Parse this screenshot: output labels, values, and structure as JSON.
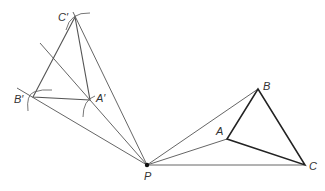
{
  "diagram": {
    "points": {
      "P": {
        "label": "P",
        "x": 147,
        "y": 165
      },
      "A": {
        "label": "A",
        "x": 227,
        "y": 139
      },
      "B": {
        "label": "B",
        "x": 258,
        "y": 89
      },
      "C": {
        "label": "C",
        "x": 305,
        "y": 165
      },
      "A_prime": {
        "label": "A′",
        "x": 90,
        "y": 100
      },
      "B_prime": {
        "label": "B′",
        "x": 33,
        "y": 97
      },
      "C_prime": {
        "label": "C′",
        "x": 75,
        "y": 17
      }
    },
    "colors": {
      "line": "#555555",
      "triangle": "#222222",
      "label": "#333333"
    }
  }
}
